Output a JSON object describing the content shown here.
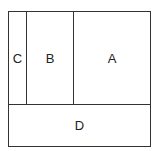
{
  "diagram": {
    "regions": [
      {
        "id": "C",
        "label": "C"
      },
      {
        "id": "B",
        "label": "B"
      },
      {
        "id": "A",
        "label": "A"
      },
      {
        "id": "D",
        "label": "D"
      }
    ],
    "line_color": "#333333",
    "background": "#ffffff"
  }
}
